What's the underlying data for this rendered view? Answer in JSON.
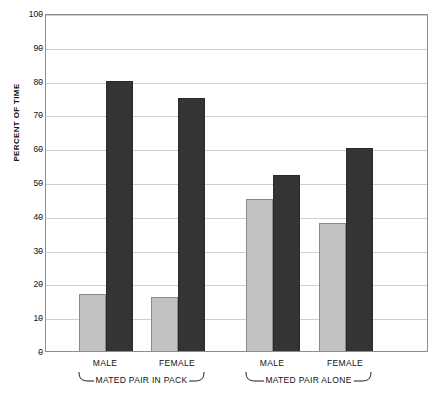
{
  "chart_data": {
    "type": "bar",
    "title": "",
    "subtitle": "",
    "xlabel": "",
    "ylabel": "PERCENT OF TIME",
    "ylim": [
      0,
      100
    ],
    "yticks": [
      0,
      10,
      20,
      30,
      40,
      50,
      60,
      70,
      80,
      90,
      100
    ],
    "grid": true,
    "legend": "none",
    "categories": [
      "MALE",
      "FEMALE",
      "MALE",
      "FEMALE"
    ],
    "groups": [
      {
        "label": "MATED PAIR IN PACK",
        "categories": [
          "MALE",
          "FEMALE"
        ]
      },
      {
        "label": "MATED PAIR ALONE",
        "categories": [
          "MALE",
          "FEMALE"
        ]
      }
    ],
    "series": [
      {
        "name": "light-gray-series",
        "color": "#c2c2c2",
        "values": [
          17,
          16,
          45,
          38
        ]
      },
      {
        "name": "dark-gray-series",
        "color": "#343434",
        "values": [
          80,
          75,
          52,
          60
        ]
      }
    ],
    "bars": [
      {
        "group": "MATED PAIR IN PACK",
        "category": "MALE",
        "series": "light-gray-series",
        "value": 17
      },
      {
        "group": "MATED PAIR IN PACK",
        "category": "MALE",
        "series": "dark-gray-series",
        "value": 80
      },
      {
        "group": "MATED PAIR IN PACK",
        "category": "FEMALE",
        "series": "light-gray-series",
        "value": 16
      },
      {
        "group": "MATED PAIR IN PACK",
        "category": "FEMALE",
        "series": "dark-gray-series",
        "value": 75
      },
      {
        "group": "MATED PAIR ALONE",
        "category": "MALE",
        "series": "light-gray-series",
        "value": 45
      },
      {
        "group": "MATED PAIR ALONE",
        "category": "MALE",
        "series": "dark-gray-series",
        "value": 52
      },
      {
        "group": "MATED PAIR ALONE",
        "category": "FEMALE",
        "series": "light-gray-series",
        "value": 38
      },
      {
        "group": "MATED PAIR ALONE",
        "category": "FEMALE",
        "series": "dark-gray-series",
        "value": 60
      }
    ]
  },
  "axis": {
    "y_title": "PERCENT OF TIME",
    "y_tick_labels": [
      "100",
      "90",
      "80",
      "70",
      "60",
      "50",
      "40",
      "30",
      "20",
      "10",
      "0"
    ]
  },
  "labels": {
    "cat_0": "MALE",
    "cat_1": "FEMALE",
    "cat_2": "MALE",
    "cat_3": "FEMALE",
    "group_0": "MATED PAIR IN PACK",
    "group_1": "MATED PAIR ALONE"
  },
  "colors": {
    "light_bar": "#c2c2c2",
    "dark_bar": "#343434",
    "gridline": "#cfcfcf",
    "frame": "#8d8d8d",
    "text": "#111111",
    "background": "#ffffff"
  }
}
